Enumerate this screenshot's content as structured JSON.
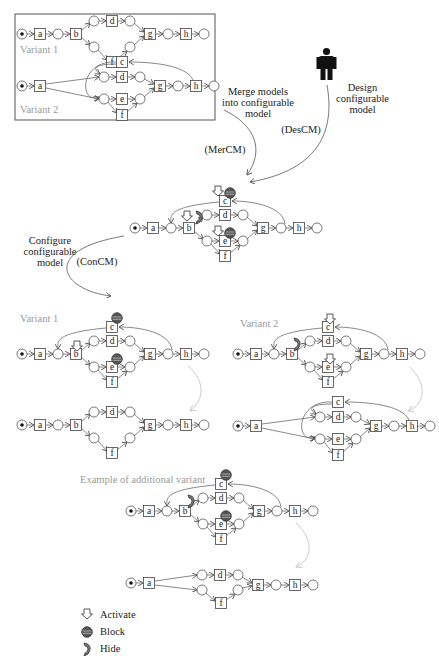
{
  "top_box": {
    "variant1_label": "Variant 1",
    "variant2_label": "Variant 2"
  },
  "steps": {
    "merge": {
      "label_line1": "Merge models",
      "label_line2": "into configurable",
      "label_line3": "model",
      "code": "(MerCM)"
    },
    "design": {
      "label_line1": "Design",
      "label_line2": "configurable",
      "label_line3": "model",
      "code": "(DesCM)"
    },
    "configure": {
      "label_line1": "Configure",
      "label_line2": "configurable",
      "label_line3": "model",
      "code": "(ConCM)"
    }
  },
  "configured": {
    "variant1_label": "Variant 1",
    "variant2_label": "Variant 2",
    "additional_label": "Example of additional variant"
  },
  "transitions": [
    "a",
    "b",
    "c",
    "d",
    "e",
    "f",
    "g",
    "h"
  ],
  "legend": [
    {
      "icon": "activate-icon",
      "label": "Activate"
    },
    {
      "icon": "block-icon",
      "label": "Block"
    },
    {
      "icon": "hide-icon",
      "label": "Hide"
    }
  ],
  "colors": {
    "line": "#555555",
    "box": "#333333",
    "muted_label": "#9a9a9a",
    "faint_arrow": "#cccccc",
    "block": "#555555"
  }
}
